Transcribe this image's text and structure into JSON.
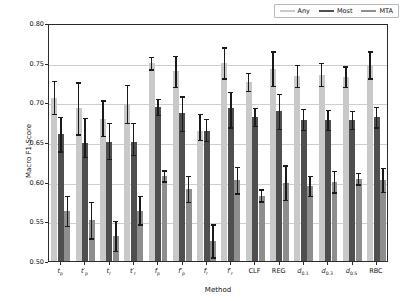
{
  "chart_data": {
    "type": "bar",
    "title": "",
    "xlabel": "Method",
    "ylabel": "Macro F1-Score",
    "ylim": [
      0.5,
      0.8
    ],
    "yticks": [
      "0.50",
      "0.55",
      "0.60",
      "0.65",
      "0.70",
      "0.75",
      "0.80"
    ],
    "ytick_values": [
      0.5,
      0.55,
      0.6,
      0.65,
      0.7,
      0.75,
      0.8
    ],
    "grid": true,
    "legend_position": "upper right",
    "legend": [
      "Any",
      "Most",
      "MTA"
    ],
    "colors": {
      "Any": "#c9c9c9",
      "Most": "#4f4f4f",
      "MTA": "#8e8e8e"
    },
    "categories": [
      "t_p",
      "t_p*",
      "t_r",
      "t_r*",
      "f_p",
      "f_p*",
      "f_r",
      "f_r*",
      "CLF",
      "REG",
      "d_0.1",
      "d_0.3",
      "d_0.5",
      "RBC"
    ],
    "categories_display": [
      {
        "base": "t",
        "sub": "p",
        "prime": false
      },
      {
        "base": "t",
        "sub": "p",
        "prime": true
      },
      {
        "base": "t",
        "sub": "r",
        "prime": false
      },
      {
        "base": "t",
        "sub": "r",
        "prime": true
      },
      {
        "base": "f",
        "sub": "p",
        "prime": false
      },
      {
        "base": "f",
        "sub": "p",
        "prime": true
      },
      {
        "base": "f",
        "sub": "r",
        "prime": false
      },
      {
        "base": "f",
        "sub": "r",
        "prime": true
      },
      {
        "base": "CLF",
        "sub": "",
        "prime": false
      },
      {
        "base": "REG",
        "sub": "",
        "prime": false
      },
      {
        "base": "d",
        "sub": "0.1",
        "prime": false
      },
      {
        "base": "d",
        "sub": "0.3",
        "prime": false
      },
      {
        "base": "d",
        "sub": "0.5",
        "prime": false
      },
      {
        "base": "RBC",
        "sub": "",
        "prime": false
      }
    ],
    "series": [
      {
        "name": "Any",
        "values": [
          0.708,
          0.695,
          0.682,
          0.701,
          0.752,
          0.742,
          0.667,
          0.752,
          0.728,
          0.745,
          0.736,
          0.737,
          0.735,
          0.75
        ],
        "err_low": [
          0.688,
          0.662,
          0.66,
          0.677,
          0.744,
          0.722,
          0.655,
          0.733,
          0.717,
          0.723,
          0.722,
          0.723,
          0.722,
          0.733
        ],
        "err_high": [
          0.73,
          0.728,
          0.705,
          0.725,
          0.76,
          0.761,
          0.688,
          0.772,
          0.74,
          0.767,
          0.75,
          0.752,
          0.748,
          0.767
        ]
      },
      {
        "name": "Most",
        "values": [
          0.663,
          0.651,
          0.652,
          0.652,
          0.697,
          0.689,
          0.667,
          0.695,
          0.684,
          0.691,
          0.68,
          0.68,
          0.68,
          0.684
        ],
        "err_low": [
          0.641,
          0.634,
          0.631,
          0.636,
          0.687,
          0.667,
          0.654,
          0.671,
          0.673,
          0.669,
          0.668,
          0.668,
          0.669,
          0.671
        ],
        "err_high": [
          0.684,
          0.683,
          0.677,
          0.677,
          0.707,
          0.71,
          0.682,
          0.716,
          0.696,
          0.713,
          0.694,
          0.693,
          0.692,
          0.697
        ]
      },
      {
        "name": "MTA",
        "values": [
          0.566,
          0.554,
          0.534,
          0.566,
          0.61,
          0.593,
          0.528,
          0.604,
          0.585,
          0.601,
          0.597,
          0.602,
          0.606,
          0.604
        ],
        "err_low": [
          0.547,
          0.531,
          0.515,
          0.549,
          0.603,
          0.577,
          0.507,
          0.588,
          0.578,
          0.58,
          0.585,
          0.589,
          0.599,
          0.59
        ],
        "err_high": [
          0.585,
          0.577,
          0.553,
          0.585,
          0.617,
          0.61,
          0.549,
          0.621,
          0.593,
          0.623,
          0.61,
          0.616,
          0.614,
          0.62
        ]
      }
    ]
  }
}
